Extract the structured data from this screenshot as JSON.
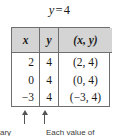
{
  "figure": {
    "title": {
      "variable": "y",
      "operator": "=",
      "value": "4",
      "full": "y = 4"
    },
    "table": {
      "headers": [
        "x",
        "y",
        "(x, y)"
      ],
      "rows": [
        {
          "x": "2",
          "y": "4",
          "pair": "(2, 4)"
        },
        {
          "x": "0",
          "y": "4",
          "pair": "(0, 4)"
        },
        {
          "x": "−3",
          "y": "4",
          "pair": "(−3, 4)"
        }
      ],
      "header_bg": "#d4d4d4",
      "border_color": "#6e6e6e"
    },
    "annotations": {
      "arrow_x_label": "up-arrow pointing to x column",
      "arrow_y_label": "up-arrow pointing to y column",
      "caption_left": "ary",
      "caption_right": "Each value of"
    }
  }
}
